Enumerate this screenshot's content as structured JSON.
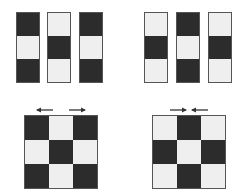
{
  "colors": {
    "dark": "#2c2c2c",
    "light": "#efefef",
    "border": "#555555",
    "arrow": "#333333"
  },
  "panels": [
    {
      "id": "top-left",
      "type": "strips",
      "x": 16,
      "y": 12,
      "strips": [
        [
          "dark",
          "light",
          "dark"
        ],
        [
          "light",
          "dark",
          "light"
        ],
        [
          "dark",
          "light",
          "dark"
        ]
      ],
      "strip_x": [
        16,
        47,
        79
      ]
    },
    {
      "id": "top-right",
      "type": "strips",
      "x": 144,
      "y": 12,
      "strips": [
        [
          "light",
          "dark",
          "light"
        ],
        [
          "dark",
          "light",
          "dark"
        ],
        [
          "light",
          "dark",
          "light"
        ]
      ],
      "strip_x": [
        144,
        176,
        208
      ]
    },
    {
      "id": "bottom-left",
      "type": "grid",
      "x": 24,
      "y": 115,
      "cells": [
        "dark",
        "light",
        "dark",
        "light",
        "dark",
        "light",
        "dark",
        "light",
        "dark"
      ],
      "arrows": "outward"
    },
    {
      "id": "bottom-right",
      "type": "grid",
      "x": 152,
      "y": 115,
      "cells": [
        "light",
        "dark",
        "light",
        "dark",
        "light",
        "dark",
        "light",
        "dark",
        "light"
      ],
      "arrows": "inward"
    }
  ]
}
